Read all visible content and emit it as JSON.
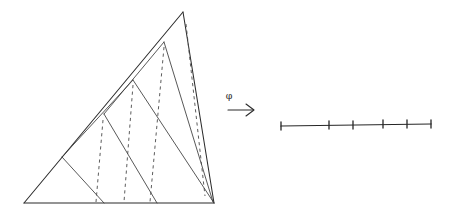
{
  "figure": {
    "title": "",
    "background_color": "#ffffff",
    "ink_color": "#2b2b2b",
    "width": 451,
    "height": 222
  },
  "map_arrow": {
    "label": "φ",
    "label_name": "phi",
    "glyph": "arrow-right",
    "shaft": {
      "x1": 228,
      "y1": 109,
      "x2": 255,
      "y2": 109
    },
    "label_pos": {
      "x": 229,
      "y": 98
    }
  },
  "triangle": {
    "name": "subdivided-triangle",
    "vertices": {
      "apex": {
        "x": 183,
        "y": 12
      },
      "bottom_left": {
        "x": 24,
        "y": 203
      },
      "bottom_right": {
        "x": 214,
        "y": 203
      }
    },
    "edges": [
      {
        "name": "hypotenuse-left",
        "from": "bottom_left",
        "to": "apex"
      },
      {
        "name": "edge-right",
        "from": "apex",
        "to": "bottom_right"
      },
      {
        "name": "base",
        "from": "bottom_left",
        "to": "bottom_right"
      }
    ],
    "solid_cuts": [
      {
        "name": "cut-1",
        "x1": 62,
        "y1": 157,
        "x2": 104,
        "y2": 203
      },
      {
        "name": "cut-2",
        "x1": 104,
        "y1": 114,
        "x2": 157,
        "y2": 203
      },
      {
        "name": "cut-3",
        "x1": 133,
        "y1": 80,
        "x2": 214,
        "y2": 203
      },
      {
        "name": "cut-4",
        "x1": 164,
        "y1": 42,
        "x2": 214,
        "y2": 203
      },
      {
        "name": "cut-5",
        "x1": 62,
        "y1": 157,
        "x2": 133,
        "y2": 80
      }
    ],
    "dashed_cuts": [
      {
        "name": "dash-1",
        "x1": 102,
        "y1": 121,
        "x2": 96,
        "y2": 203
      },
      {
        "name": "dash-2",
        "x1": 132,
        "y1": 86,
        "x2": 124,
        "y2": 203
      },
      {
        "name": "dash-3",
        "x1": 163,
        "y1": 48,
        "x2": 150,
        "y2": 203
      },
      {
        "name": "dash-4",
        "x1": 186,
        "y1": 24,
        "x2": 204,
        "y2": 197
      }
    ]
  },
  "segment": {
    "name": "tick-marked-segment",
    "line": {
      "x1": 281,
      "y1": 126,
      "x2": 431,
      "y2": 124
    },
    "tick_half_height": 4,
    "ticks": [
      {
        "name": "tick-0",
        "x": 281,
        "y": 126
      },
      {
        "name": "tick-1",
        "x": 329,
        "y": 125
      },
      {
        "name": "tick-2",
        "x": 353,
        "y": 125
      },
      {
        "name": "tick-3",
        "x": 383,
        "y": 124
      },
      {
        "name": "tick-4",
        "x": 407,
        "y": 124
      },
      {
        "name": "tick-5",
        "x": 431,
        "y": 124
      }
    ]
  }
}
